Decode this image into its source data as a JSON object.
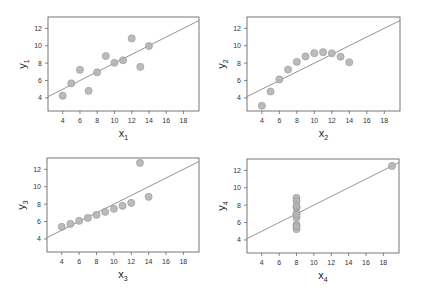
{
  "chart_data": [
    {
      "type": "scatter",
      "title": "",
      "xlabel": "x1",
      "ylabel": "y1",
      "xlim": [
        2.3,
        19.8
      ],
      "ylim": [
        2.5,
        13.3
      ],
      "xticks": [
        4,
        6,
        8,
        10,
        12,
        14,
        16,
        18
      ],
      "yticks": [
        4,
        6,
        8,
        10,
        12
      ],
      "x": [
        10,
        8,
        13,
        9,
        11,
        14,
        6,
        4,
        12,
        7,
        5
      ],
      "y": [
        8.04,
        6.95,
        7.58,
        8.81,
        8.33,
        9.96,
        7.24,
        4.26,
        10.84,
        4.82,
        5.68
      ],
      "fit_line": {
        "intercept": 3.0,
        "slope": 0.5
      },
      "grid": false
    },
    {
      "type": "scatter",
      "title": "",
      "xlabel": "x2",
      "ylabel": "y2",
      "xlim": [
        2.3,
        19.8
      ],
      "ylim": [
        2.5,
        13.3
      ],
      "xticks": [
        4,
        6,
        8,
        10,
        12,
        14,
        16,
        18
      ],
      "yticks": [
        4,
        6,
        8,
        10,
        12
      ],
      "x": [
        10,
        8,
        13,
        9,
        11,
        14,
        6,
        4,
        12,
        7,
        5
      ],
      "y": [
        9.14,
        8.14,
        8.74,
        8.77,
        9.26,
        8.1,
        6.13,
        3.1,
        9.13,
        7.26,
        4.74
      ],
      "fit_line": {
        "intercept": 3.0,
        "slope": 0.5
      },
      "grid": false
    },
    {
      "type": "scatter",
      "title": "",
      "xlabel": "x3",
      "ylabel": "y3",
      "xlim": [
        2.3,
        19.8
      ],
      "ylim": [
        2.5,
        13.3
      ],
      "xticks": [
        4,
        6,
        8,
        10,
        12,
        14,
        16,
        18
      ],
      "yticks": [
        4,
        6,
        8,
        10,
        12
      ],
      "x": [
        10,
        8,
        13,
        9,
        11,
        14,
        6,
        4,
        12,
        7,
        5
      ],
      "y": [
        7.46,
        6.77,
        12.74,
        7.11,
        7.81,
        8.84,
        6.08,
        5.39,
        8.15,
        6.42,
        5.73
      ],
      "fit_line": {
        "intercept": 3.0,
        "slope": 0.5
      },
      "grid": false
    },
    {
      "type": "scatter",
      "title": "",
      "xlabel": "x4",
      "ylabel": "y4",
      "xlim": [
        2.3,
        19.8
      ],
      "ylim": [
        2.5,
        13.3
      ],
      "xticks": [
        4,
        6,
        8,
        10,
        12,
        14,
        16,
        18
      ],
      "yticks": [
        4,
        6,
        8,
        10,
        12
      ],
      "x": [
        8,
        8,
        8,
        8,
        8,
        8,
        8,
        19,
        8,
        8,
        8
      ],
      "y": [
        6.58,
        5.76,
        7.71,
        8.84,
        8.47,
        7.04,
        5.25,
        12.5,
        5.56,
        7.91,
        6.89
      ],
      "fit_line": {
        "intercept": 3.0,
        "slope": 0.5
      },
      "grid": false
    }
  ],
  "panels": [
    {
      "xlabel": "x",
      "xsub": "1",
      "ylabel": "y",
      "ysub": "1"
    },
    {
      "xlabel": "x",
      "xsub": "2",
      "ylabel": "y",
      "ysub": "2"
    },
    {
      "xlabel": "x",
      "xsub": "3",
      "ylabel": "y",
      "ysub": "3"
    },
    {
      "xlabel": "x",
      "xsub": "4",
      "ylabel": "y",
      "ysub": "4"
    }
  ],
  "colors": {
    "point_fill": "#b4b4b4",
    "point_stroke": "#8c8c8c",
    "line": "#777777",
    "frame": "#555555"
  }
}
